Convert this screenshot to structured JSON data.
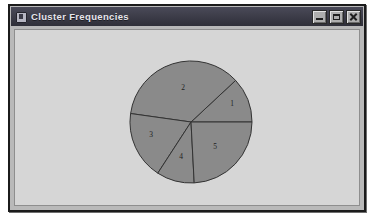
{
  "window": {
    "title": "Cluster Frequencies",
    "icon": "chart-window-icon",
    "controls": {
      "minimize_label": "Minimize",
      "maximize_label": "Maximize",
      "close_label": "Close"
    },
    "titlebar_color": "#3b3b47",
    "client_color": "#d6d6d6",
    "border_color": "#1b1b1b"
  },
  "chart_data": {
    "type": "pie",
    "title": "Cluster Frequencies",
    "xlabel": "",
    "ylabel": "",
    "legend": "none",
    "grid": false,
    "slice_color": "#8a8a8a",
    "outline_color": "#333333",
    "start_angle_deg": 0,
    "direction": "counterclockwise",
    "center": {
      "x": 191,
      "y": 122
    },
    "radius": 61,
    "categories": [
      "1",
      "2",
      "3",
      "4",
      "5"
    ],
    "values": [
      12,
      36,
      18,
      10,
      24
    ],
    "labels": [
      "1",
      "2",
      "3",
      "4",
      "5"
    ],
    "slices": [
      {
        "label": "1",
        "value": 12,
        "start_deg": 0,
        "end_deg": 43,
        "label_x": 232,
        "label_y": 104
      },
      {
        "label": "2",
        "value": 36,
        "start_deg": 43,
        "end_deg": 172,
        "label_x": 183,
        "label_y": 88
      },
      {
        "label": "3",
        "value": 18,
        "start_deg": 172,
        "end_deg": 237,
        "label_x": 151,
        "label_y": 135
      },
      {
        "label": "4",
        "value": 10,
        "start_deg": 237,
        "end_deg": 273,
        "label_x": 181,
        "label_y": 157
      },
      {
        "label": "5",
        "value": 24,
        "start_deg": 273,
        "end_deg": 360,
        "label_x": 215,
        "label_y": 147
      }
    ]
  }
}
